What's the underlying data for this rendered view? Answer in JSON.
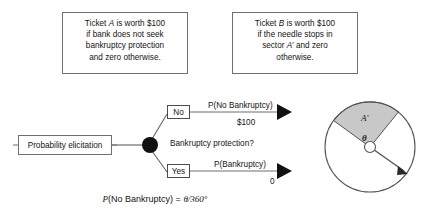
{
  "figure": {
    "ticket_a": {
      "lines": [
        "Ticket A is worth $100",
        "if bank does not seek",
        "bankruptcy protection",
        "and zero otherwise."
      ]
    },
    "ticket_b": {
      "lines": [
        "Ticket B is worth $100",
        "if the needle stops in",
        "sector A′ and zero",
        "otherwise."
      ]
    },
    "tree": {
      "root_label": "Probability elicitation",
      "decision_question": "Bankruptcy protection?",
      "branch_no": {
        "option": "No",
        "probability": "P(No Bankruptcy)",
        "payoff": "$100"
      },
      "branch_yes": {
        "option": "Yes",
        "probability": "P(Bankruptcy)",
        "payoff": "0"
      }
    },
    "wheel": {
      "sector_label": "A′",
      "angle_label": "θ",
      "sector_fill": "#c8c8c8",
      "outline_color": "#555555"
    },
    "formula": {
      "left": "P(No Bankruptcy)",
      "equals": "=",
      "right": "θ/360°"
    },
    "colors": {
      "line": "#6f6f6f",
      "node_fill": "#111111",
      "background": "#ffffff"
    }
  }
}
